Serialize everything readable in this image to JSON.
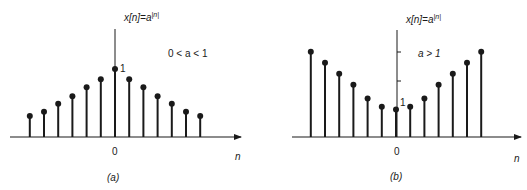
{
  "colors": {
    "ink": "#1a1a1a",
    "background": "#ffffff"
  },
  "panels": [
    {
      "id": "a",
      "caption": "(a)",
      "equation": {
        "lhs": "x[n]=a",
        "exp": "|n|"
      },
      "condition": "0 < a < 1",
      "origin_label": "0",
      "axis_label": "n",
      "unit_label": "1"
    },
    {
      "id": "b",
      "caption": "(b)",
      "equation": {
        "lhs": "x[n]=a",
        "exp": "|n|"
      },
      "condition": "a > 1",
      "origin_label": "0",
      "axis_label": "n",
      "unit_label": "1"
    }
  ],
  "chart_data": [
    {
      "type": "stem",
      "title": "x[n]=a^|n|, 0 < a < 1",
      "xlabel": "n",
      "x": [
        -6,
        -5,
        -4,
        -3,
        -2,
        -1,
        0,
        1,
        2,
        3,
        4,
        5,
        6
      ],
      "values": [
        0.31,
        0.37,
        0.49,
        0.6,
        0.73,
        0.85,
        1.0,
        0.85,
        0.73,
        0.6,
        0.49,
        0.37,
        0.31
      ]
    },
    {
      "type": "stem",
      "title": "x[n]=a^|n|, a > 1",
      "xlabel": "n",
      "x": [
        -6,
        -5,
        -4,
        -3,
        -2,
        -1,
        0,
        1,
        2,
        3,
        4,
        5,
        6
      ],
      "values": [
        3.1,
        2.7,
        2.3,
        1.9,
        1.4,
        1.1,
        1.0,
        1.1,
        1.4,
        1.9,
        2.3,
        2.7,
        3.1
      ]
    }
  ]
}
